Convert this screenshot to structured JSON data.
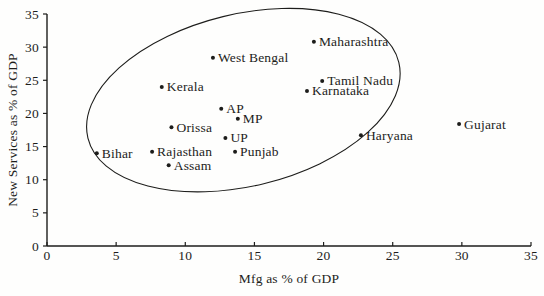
{
  "chart_data": {
    "type": "scatter",
    "title": "",
    "xlabel": "Mfg as % of GDP",
    "ylabel": "New Services as % of GDP",
    "xlim": [
      0,
      35
    ],
    "ylim": [
      0,
      35
    ],
    "xticks": [
      0,
      5,
      10,
      15,
      20,
      25,
      30,
      35
    ],
    "yticks": [
      0,
      5,
      10,
      15,
      20,
      25,
      30,
      35
    ],
    "grid": false,
    "legend": "none",
    "marker": "small-black-dot",
    "points": [
      {
        "label": "Maharashtra",
        "x": 19.3,
        "y": 30.8
      },
      {
        "label": "West Bengal",
        "x": 12.0,
        "y": 28.4
      },
      {
        "label": "Tamil Nadu",
        "x": 19.9,
        "y": 24.9
      },
      {
        "label": "Kerala",
        "x": 8.3,
        "y": 24.0
      },
      {
        "label": "Karnataka",
        "x": 18.8,
        "y": 23.4
      },
      {
        "label": "AP",
        "x": 12.6,
        "y": 20.7
      },
      {
        "label": "MP",
        "x": 13.8,
        "y": 19.2
      },
      {
        "label": "Gujarat",
        "x": 29.8,
        "y": 18.4
      },
      {
        "label": "Orissa",
        "x": 9.0,
        "y": 17.9
      },
      {
        "label": "Haryana",
        "x": 22.7,
        "y": 16.7
      },
      {
        "label": "UP",
        "x": 12.9,
        "y": 16.3
      },
      {
        "label": "Rajasthan",
        "x": 7.6,
        "y": 14.2
      },
      {
        "label": "Punjab",
        "x": 13.6,
        "y": 14.2
      },
      {
        "label": "Bihar",
        "x": 3.6,
        "y": 14.0
      },
      {
        "label": "Assam",
        "x": 8.8,
        "y": 12.2
      }
    ],
    "ellipse": {
      "description": "hand-drawn cluster ellipse enclosing all states except Gujarat and Haryana",
      "cx": 14.2,
      "cy": 22.0,
      "rx_px": 160,
      "ry_px": 86,
      "rotate_deg": -13.7
    },
    "colors": {
      "ink": "#1d1d1b",
      "background": "#fefefd"
    }
  }
}
